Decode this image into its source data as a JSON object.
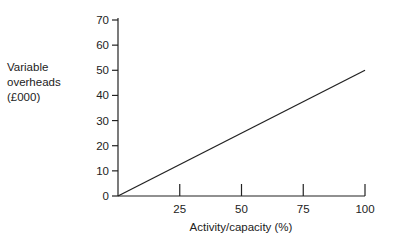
{
  "chart_data": {
    "type": "line",
    "title": "",
    "xlabel": "Activity/capacity (%)",
    "ylabel": "Variable overheads (£000)",
    "ylabel_lines": [
      "Variable",
      "overheads",
      "(£000)"
    ],
    "xlim": [
      0,
      100
    ],
    "ylim": [
      0,
      70
    ],
    "x_ticks": [
      25,
      50,
      75,
      100
    ],
    "y_ticks": [
      0,
      10,
      20,
      30,
      40,
      50,
      60,
      70
    ],
    "grid": false,
    "legend": null,
    "series": [
      {
        "name": "Variable overheads",
        "x": [
          0,
          100
        ],
        "y": [
          0,
          50
        ],
        "color": "#222222"
      }
    ]
  }
}
